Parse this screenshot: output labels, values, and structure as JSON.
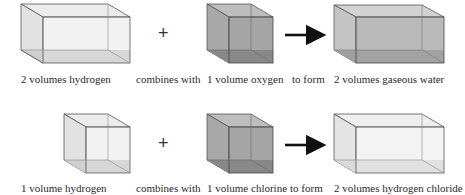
{
  "reactions": [
    {
      "reactant1": {
        "label": "2 volumes hydrogen",
        "volumes": 2,
        "gas": "hydrogen",
        "fill": "#e6e6e6"
      },
      "connector": "combines with",
      "operator": "+",
      "reactant2": {
        "label": "1 volume oxygen",
        "volumes": 1,
        "gas": "oxygen",
        "fill": "#9a9a9a"
      },
      "result_connector": "to form",
      "product": {
        "label": "2 volumes gaseous water",
        "volumes": 2,
        "gas": "gaseous water",
        "fill": "#b0b0b0"
      }
    },
    {
      "reactant1": {
        "label": "1 volume hydrogen",
        "volumes": 1,
        "gas": "hydrogen",
        "fill": "#e6e6e6"
      },
      "connector": "combines with",
      "operator": "+",
      "reactant2": {
        "label": "1 volume chlorine",
        "volumes": 1,
        "gas": "chlorine",
        "fill": "#9a9a9a"
      },
      "result_connector": "to form",
      "product": {
        "label": "2 volumes hydrogen chloride",
        "volumes": 2,
        "gas": "hydrogen chloride",
        "fill": "#e3e3e3"
      }
    }
  ],
  "arrow_icon": "right-arrow"
}
